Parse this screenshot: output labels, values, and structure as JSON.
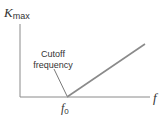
{
  "diagram": {
    "y_axis_label": {
      "symbol": "K",
      "subscript": "max"
    },
    "x_axis_label": "f",
    "cutoff_marker": {
      "symbol": "f",
      "subscript": "0"
    },
    "annotation": {
      "line1": "Cutoff",
      "line2": "frequency"
    },
    "colors": {
      "axis": "#8a8a8a",
      "curve": "#8a8a8a",
      "text": "#333333"
    }
  }
}
